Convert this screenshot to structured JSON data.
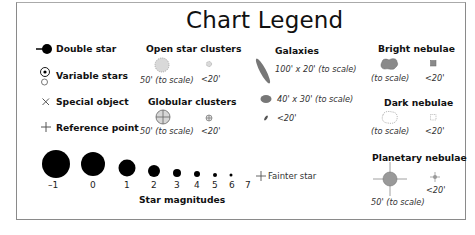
{
  "title": "Chart Legend",
  "stars": {
    "double_star": "Double star",
    "variable_stars": "Variable stars",
    "special_object": "Special object",
    "reference_point": "Reference point"
  },
  "open_clusters": {
    "heading": "Open star clusters",
    "scale_label": "50' (to scale)",
    "small_label": "<20'"
  },
  "globular_clusters": {
    "heading": "Globular clusters",
    "scale_label": "50' (to scale)",
    "small_label": "<20'"
  },
  "galaxies": {
    "heading": "Galaxies",
    "large_label": "100' x 20' (to scale)",
    "medium_label": "40' x 30' (to scale)",
    "small_label": "<20'"
  },
  "bright_nebulae": {
    "heading": "Bright nebulae",
    "scale_label": "(to scale)",
    "small_label": "<20'"
  },
  "dark_nebulae": {
    "heading": "Dark nebulae",
    "scale_label": "(to scale)",
    "small_label": "<20'"
  },
  "planetary_nebulae": {
    "heading": "Planetary nebulae",
    "scale_label": "50' (to scale)",
    "small_label": "<20'"
  },
  "magnitudes": {
    "heading": "Star magnitudes",
    "values": [
      "–1",
      "0",
      "1",
      "2",
      "3",
      "4",
      "5",
      "6",
      "7"
    ],
    "fainter_label": "Fainter star"
  },
  "colors": {
    "object_fill": "#bdbdbd",
    "galaxy_fill": "#777777",
    "nebula_fill": "#8a8a8a",
    "border": "#8a8a8a"
  }
}
